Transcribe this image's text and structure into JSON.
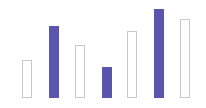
{
  "chart_data": {
    "type": "bar",
    "title": "",
    "xlabel": "",
    "ylabel": "",
    "grid": false,
    "legend": null,
    "baseline_y": 98,
    "categories": [
      "1",
      "2",
      "3",
      "4",
      "5",
      "6",
      "7"
    ],
    "values": [
      38,
      72,
      53,
      31,
      67,
      89,
      79
    ],
    "styles": [
      "outline",
      "filled",
      "outline",
      "filled",
      "outline",
      "filled",
      "outline"
    ],
    "x_positions": [
      22,
      49,
      75,
      102,
      127,
      154,
      180
    ],
    "bar_width": 10,
    "colors": {
      "filled": "#5a56b0",
      "outline": "#c8c8c8"
    }
  }
}
